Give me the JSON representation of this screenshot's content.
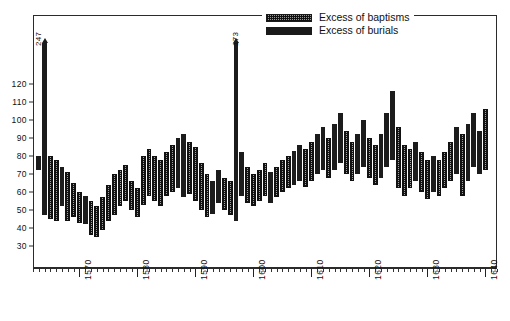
{
  "legend": {
    "position": "top-right",
    "items": [
      {
        "label": "Excess of baptisms",
        "swatch": "stippled-hatch",
        "color": "#9a9a9a"
      },
      {
        "label": "Excess of burials",
        "swatch": "solid",
        "color": "#1a1a1a"
      }
    ]
  },
  "chart_data": {
    "type": "bar",
    "subtype": "floating-range-bars",
    "title": "",
    "subtitle": "",
    "xlabel": "",
    "ylabel": "",
    "grid": false,
    "xlim": [
      1562,
      1642
    ],
    "ylim": [
      0,
      140
    ],
    "yticks": [
      30,
      40,
      50,
      60,
      70,
      80,
      90,
      100,
      110,
      120
    ],
    "ytick_labels": [
      "30",
      "40",
      "50",
      "60",
      "70",
      "80",
      "90",
      "100",
      "110",
      "120"
    ],
    "xticks": [
      1570,
      1580,
      1590,
      1600,
      1610,
      1620,
      1630,
      1640
    ],
    "xtick_labels": [
      "1570",
      "1580",
      "1590",
      "1600",
      "1610",
      "1620",
      "1630",
      "1640"
    ],
    "xtick_minor_step": 1,
    "annotations": [
      {
        "text": "247",
        "year": 1563,
        "value": 247,
        "note": "off-scale peak, arrow clipped at top"
      },
      {
        "text": "173",
        "year": 1597,
        "value": 173,
        "note": "off-scale peak, arrow clipped at top"
      }
    ],
    "series": [
      {
        "name": "Excess of baptisms",
        "color": "#9a9a9a",
        "fill": "stippled-hatch"
      },
      {
        "name": "Excess of burials",
        "color": "#1a1a1a",
        "fill": "solid"
      }
    ],
    "bars": [
      {
        "year": 1563,
        "low": 72,
        "high": 80,
        "type": "burials"
      },
      {
        "year": 1564,
        "low": 47,
        "high": 140,
        "type": "burials",
        "clipped": true,
        "peak": 247
      },
      {
        "year": 1565,
        "low": 45,
        "high": 80,
        "type": "baptisms"
      },
      {
        "year": 1566,
        "low": 44,
        "high": 78,
        "type": "baptisms"
      },
      {
        "year": 1567,
        "low": 52,
        "high": 74,
        "type": "burials"
      },
      {
        "year": 1568,
        "low": 44,
        "high": 71,
        "type": "baptisms"
      },
      {
        "year": 1569,
        "low": 46,
        "high": 65,
        "type": "baptisms"
      },
      {
        "year": 1570,
        "low": 43,
        "high": 60,
        "type": "baptisms"
      },
      {
        "year": 1571,
        "low": 42,
        "high": 58,
        "type": "burials"
      },
      {
        "year": 1572,
        "low": 36,
        "high": 55,
        "type": "baptisms"
      },
      {
        "year": 1573,
        "low": 35,
        "high": 52,
        "type": "baptisms"
      },
      {
        "year": 1574,
        "low": 39,
        "high": 57,
        "type": "baptisms"
      },
      {
        "year": 1575,
        "low": 44,
        "high": 64,
        "type": "baptisms"
      },
      {
        "year": 1576,
        "low": 47,
        "high": 70,
        "type": "baptisms"
      },
      {
        "year": 1577,
        "low": 52,
        "high": 72,
        "type": "baptisms"
      },
      {
        "year": 1578,
        "low": 55,
        "high": 75,
        "type": "baptisms"
      },
      {
        "year": 1579,
        "low": 50,
        "high": 66,
        "type": "baptisms"
      },
      {
        "year": 1580,
        "low": 46,
        "high": 62,
        "type": "baptisms"
      },
      {
        "year": 1581,
        "low": 53,
        "high": 80,
        "type": "baptisms"
      },
      {
        "year": 1582,
        "low": 58,
        "high": 84,
        "type": "baptisms"
      },
      {
        "year": 1583,
        "low": 55,
        "high": 80,
        "type": "baptisms"
      },
      {
        "year": 1584,
        "low": 52,
        "high": 78,
        "type": "baptisms"
      },
      {
        "year": 1585,
        "low": 58,
        "high": 82,
        "type": "baptisms"
      },
      {
        "year": 1586,
        "low": 60,
        "high": 86,
        "type": "baptisms"
      },
      {
        "year": 1587,
        "low": 62,
        "high": 90,
        "type": "burials"
      },
      {
        "year": 1588,
        "low": 57,
        "high": 92,
        "type": "burials"
      },
      {
        "year": 1589,
        "low": 59,
        "high": 88,
        "type": "baptisms"
      },
      {
        "year": 1590,
        "low": 55,
        "high": 85,
        "type": "baptisms"
      },
      {
        "year": 1591,
        "low": 50,
        "high": 76,
        "type": "baptisms"
      },
      {
        "year": 1592,
        "low": 46,
        "high": 70,
        "type": "baptisms"
      },
      {
        "year": 1593,
        "low": 48,
        "high": 66,
        "type": "burials"
      },
      {
        "year": 1594,
        "low": 54,
        "high": 72,
        "type": "burials"
      },
      {
        "year": 1595,
        "low": 50,
        "high": 68,
        "type": "baptisms"
      },
      {
        "year": 1596,
        "low": 47,
        "high": 66,
        "type": "baptisms"
      },
      {
        "year": 1597,
        "low": 44,
        "high": 140,
        "type": "burials",
        "clipped": true,
        "peak": 173
      },
      {
        "year": 1598,
        "low": 58,
        "high": 82,
        "type": "burials"
      },
      {
        "year": 1599,
        "low": 54,
        "high": 74,
        "type": "baptisms"
      },
      {
        "year": 1600,
        "low": 52,
        "high": 70,
        "type": "baptisms"
      },
      {
        "year": 1601,
        "low": 55,
        "high": 72,
        "type": "baptisms"
      },
      {
        "year": 1602,
        "low": 58,
        "high": 76,
        "type": "baptisms"
      },
      {
        "year": 1603,
        "low": 54,
        "high": 71,
        "type": "burials"
      },
      {
        "year": 1604,
        "low": 57,
        "high": 74,
        "type": "baptisms"
      },
      {
        "year": 1605,
        "low": 60,
        "high": 78,
        "type": "baptisms"
      },
      {
        "year": 1606,
        "low": 62,
        "high": 80,
        "type": "baptisms"
      },
      {
        "year": 1607,
        "low": 64,
        "high": 83,
        "type": "burials"
      },
      {
        "year": 1608,
        "low": 66,
        "high": 86,
        "type": "burials"
      },
      {
        "year": 1609,
        "low": 63,
        "high": 84,
        "type": "baptisms"
      },
      {
        "year": 1610,
        "low": 66,
        "high": 88,
        "type": "baptisms"
      },
      {
        "year": 1611,
        "low": 70,
        "high": 92,
        "type": "burials"
      },
      {
        "year": 1612,
        "low": 72,
        "high": 96,
        "type": "burials"
      },
      {
        "year": 1613,
        "low": 68,
        "high": 90,
        "type": "baptisms"
      },
      {
        "year": 1614,
        "low": 72,
        "high": 98,
        "type": "burials"
      },
      {
        "year": 1615,
        "low": 76,
        "high": 104,
        "type": "burials"
      },
      {
        "year": 1616,
        "low": 70,
        "high": 94,
        "type": "baptisms"
      },
      {
        "year": 1617,
        "low": 66,
        "high": 88,
        "type": "baptisms"
      },
      {
        "year": 1618,
        "low": 70,
        "high": 92,
        "type": "burials"
      },
      {
        "year": 1619,
        "low": 74,
        "high": 100,
        "type": "burials"
      },
      {
        "year": 1620,
        "low": 68,
        "high": 90,
        "type": "baptisms"
      },
      {
        "year": 1621,
        "low": 64,
        "high": 86,
        "type": "baptisms"
      },
      {
        "year": 1622,
        "low": 68,
        "high": 92,
        "type": "burials"
      },
      {
        "year": 1623,
        "low": 74,
        "high": 104,
        "type": "burials"
      },
      {
        "year": 1624,
        "low": 78,
        "high": 116,
        "type": "burials"
      },
      {
        "year": 1625,
        "low": 62,
        "high": 96,
        "type": "baptisms"
      },
      {
        "year": 1626,
        "low": 58,
        "high": 86,
        "type": "baptisms"
      },
      {
        "year": 1627,
        "low": 62,
        "high": 84,
        "type": "baptisms"
      },
      {
        "year": 1628,
        "low": 66,
        "high": 88,
        "type": "burials"
      },
      {
        "year": 1629,
        "low": 60,
        "high": 82,
        "type": "baptisms"
      },
      {
        "year": 1630,
        "low": 56,
        "high": 78,
        "type": "baptisms"
      },
      {
        "year": 1631,
        "low": 60,
        "high": 80,
        "type": "burials"
      },
      {
        "year": 1632,
        "low": 58,
        "high": 78,
        "type": "baptisms"
      },
      {
        "year": 1633,
        "low": 62,
        "high": 82,
        "type": "baptisms"
      },
      {
        "year": 1634,
        "low": 66,
        "high": 88,
        "type": "baptisms"
      },
      {
        "year": 1635,
        "low": 70,
        "high": 96,
        "type": "burials"
      },
      {
        "year": 1636,
        "low": 58,
        "high": 92,
        "type": "baptisms"
      },
      {
        "year": 1637,
        "low": 66,
        "high": 98,
        "type": "burials"
      },
      {
        "year": 1638,
        "low": 74,
        "high": 104,
        "type": "burials"
      },
      {
        "year": 1639,
        "low": 70,
        "high": 94,
        "type": "burials"
      },
      {
        "year": 1640,
        "low": 72,
        "high": 106,
        "type": "baptisms"
      }
    ]
  }
}
